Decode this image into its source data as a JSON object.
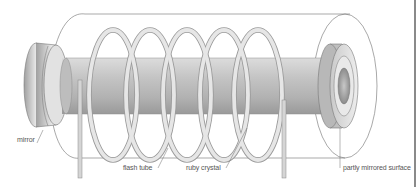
{
  "diagram": {
    "labels": {
      "mirror": "mirror",
      "flash_tube": "flash tube",
      "ruby_crystal": "ruby crystal",
      "partly_mirrored_surface": "partly mirrored surface"
    },
    "colors": {
      "line": "#6e6e6e",
      "rod_light": "#e4e4e4",
      "rod_dark": "#a9a9a9",
      "coil": "#d8d8d8",
      "background": "#ffffff"
    },
    "coil_turns": 5
  }
}
